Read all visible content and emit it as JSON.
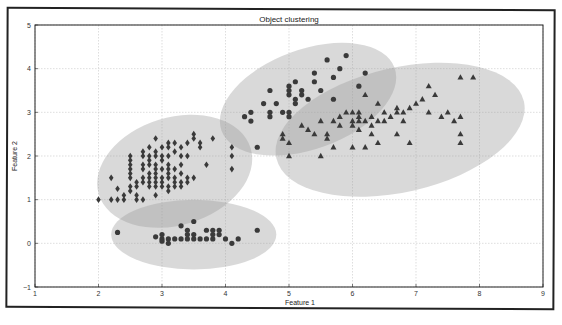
{
  "chart_data": {
    "type": "scatter",
    "title": "Object clustering",
    "xlabel": "Feature 1",
    "ylabel": "Feature 2",
    "xlim": [
      1,
      9
    ],
    "ylim": [
      -1,
      5
    ],
    "xticks": [
      "1",
      "2",
      "3",
      "4",
      "5",
      "6",
      "7",
      "8",
      "9"
    ],
    "yticks": [
      "-1",
      "0",
      "1",
      "2",
      "3",
      "4",
      "5"
    ],
    "grid": true,
    "legend": null,
    "ellipses": [
      {
        "name": "cluster-diamonds",
        "cx": 3.2,
        "cy": 1.65,
        "rx": 1.25,
        "ry": 0.65,
        "angle": -17
      },
      {
        "name": "cluster-bottom-circles",
        "cx": 3.5,
        "cy": 0.2,
        "rx": 1.3,
        "ry": 0.42,
        "angle": 0
      },
      {
        "name": "cluster-upper-circles",
        "cx": 5.3,
        "cy": 3.3,
        "rx": 1.45,
        "ry": 0.6,
        "angle": -20
      },
      {
        "name": "cluster-triangles",
        "cx": 6.75,
        "cy": 2.6,
        "rx": 2.0,
        "ry": 0.75,
        "angle": -13
      }
    ],
    "series": [
      {
        "name": "Cluster 1 (diamonds)",
        "marker": "diamond",
        "points": [
          [
            2.0,
            1.0
          ],
          [
            2.2,
            1.0
          ],
          [
            2.3,
            1.0
          ],
          [
            2.4,
            1.0
          ],
          [
            2.4,
            1.1
          ],
          [
            2.6,
            1.0
          ],
          [
            2.6,
            1.1
          ],
          [
            2.7,
            1.0
          ],
          [
            2.2,
            1.5
          ],
          [
            2.3,
            1.25
          ],
          [
            2.5,
            1.2
          ],
          [
            2.5,
            1.3
          ],
          [
            2.5,
            1.5
          ],
          [
            2.5,
            1.6
          ],
          [
            2.5,
            1.7
          ],
          [
            2.5,
            1.8
          ],
          [
            2.5,
            1.9
          ],
          [
            2.5,
            2.0
          ],
          [
            2.6,
            1.3
          ],
          [
            2.6,
            1.4
          ],
          [
            2.7,
            1.4
          ],
          [
            2.7,
            1.5
          ],
          [
            2.7,
            1.7
          ],
          [
            2.7,
            1.8
          ],
          [
            2.7,
            2.0
          ],
          [
            2.7,
            2.1
          ],
          [
            2.8,
            1.3
          ],
          [
            2.8,
            1.4
          ],
          [
            2.8,
            1.5
          ],
          [
            2.8,
            1.6
          ],
          [
            2.8,
            1.8
          ],
          [
            2.8,
            1.9
          ],
          [
            2.8,
            2.0
          ],
          [
            2.8,
            2.2
          ],
          [
            2.9,
            1.1
          ],
          [
            2.9,
            1.3
          ],
          [
            2.9,
            1.4
          ],
          [
            2.9,
            1.5
          ],
          [
            2.9,
            1.6
          ],
          [
            2.9,
            1.7
          ],
          [
            2.9,
            1.8
          ],
          [
            2.9,
            2.0
          ],
          [
            2.9,
            2.1
          ],
          [
            2.9,
            2.4
          ],
          [
            3.0,
            1.3
          ],
          [
            3.0,
            1.4
          ],
          [
            3.0,
            1.5
          ],
          [
            3.0,
            1.7
          ],
          [
            3.0,
            1.9
          ],
          [
            3.0,
            2.0
          ],
          [
            3.0,
            2.2
          ],
          [
            3.1,
            1.2
          ],
          [
            3.1,
            1.3
          ],
          [
            3.1,
            1.5
          ],
          [
            3.1,
            1.6
          ],
          [
            3.1,
            1.7
          ],
          [
            3.1,
            1.8
          ],
          [
            3.1,
            2.0
          ],
          [
            3.1,
            2.2
          ],
          [
            3.1,
            2.3
          ],
          [
            3.2,
            1.3
          ],
          [
            3.2,
            1.4
          ],
          [
            3.2,
            1.5
          ],
          [
            3.2,
            1.7
          ],
          [
            3.2,
            2.1
          ],
          [
            3.2,
            2.3
          ],
          [
            3.3,
            1.3
          ],
          [
            3.3,
            1.4
          ],
          [
            3.3,
            1.6
          ],
          [
            3.3,
            1.8
          ],
          [
            3.3,
            2.0
          ],
          [
            3.3,
            2.2
          ],
          [
            3.4,
            1.4
          ],
          [
            3.4,
            1.5
          ],
          [
            3.4,
            2.0
          ],
          [
            3.4,
            2.3
          ],
          [
            3.5,
            1.5
          ],
          [
            3.5,
            2.4
          ],
          [
            3.5,
            2.5
          ],
          [
            3.6,
            2.3
          ],
          [
            3.6,
            2.2
          ],
          [
            3.7,
            1.8
          ],
          [
            3.8,
            2.4
          ],
          [
            4.1,
            2.0
          ],
          [
            4.1,
            2.2
          ],
          [
            4.1,
            1.7
          ]
        ]
      },
      {
        "name": "Cluster 2 (bottom circles)",
        "marker": "circle",
        "points": [
          [
            2.3,
            0.25
          ],
          [
            2.9,
            0.15
          ],
          [
            3.0,
            0.1
          ],
          [
            3.0,
            0.2
          ],
          [
            3.0,
            0.05
          ],
          [
            3.1,
            0.1
          ],
          [
            3.1,
            0.0
          ],
          [
            3.2,
            0.1
          ],
          [
            3.3,
            0.1
          ],
          [
            3.3,
            0.4
          ],
          [
            3.4,
            0.1
          ],
          [
            3.4,
            0.3
          ],
          [
            3.4,
            0.2
          ],
          [
            3.5,
            0.1
          ],
          [
            3.5,
            0.2
          ],
          [
            3.5,
            0.5
          ],
          [
            3.6,
            0.1
          ],
          [
            3.7,
            0.1
          ],
          [
            3.7,
            0.3
          ],
          [
            3.8,
            0.1
          ],
          [
            3.8,
            0.2
          ],
          [
            3.8,
            0.3
          ],
          [
            3.9,
            0.2
          ],
          [
            3.9,
            0.3
          ],
          [
            4.0,
            0.1
          ],
          [
            4.1,
            0.0
          ],
          [
            4.2,
            0.1
          ],
          [
            4.5,
            0.3
          ]
        ]
      },
      {
        "name": "Cluster 3 (upper circles)",
        "marker": "circle",
        "points": [
          [
            4.3,
            2.9
          ],
          [
            4.4,
            3.0
          ],
          [
            4.4,
            2.8
          ],
          [
            4.5,
            2.2
          ],
          [
            4.6,
            3.2
          ],
          [
            4.7,
            3.5
          ],
          [
            4.7,
            3.0
          ],
          [
            4.7,
            2.9
          ],
          [
            4.8,
            3.2
          ],
          [
            4.9,
            3.0
          ],
          [
            5.0,
            3.0
          ],
          [
            5.0,
            2.9
          ],
          [
            5.0,
            3.4
          ],
          [
            5.0,
            3.6
          ],
          [
            5.0,
            3.5
          ],
          [
            5.1,
            3.7
          ],
          [
            5.1,
            3.3
          ],
          [
            5.1,
            3.2
          ],
          [
            5.2,
            3.4
          ],
          [
            5.2,
            3.5
          ],
          [
            5.3,
            3.3
          ],
          [
            5.4,
            3.7
          ],
          [
            5.4,
            3.9
          ],
          [
            5.5,
            3.5
          ],
          [
            5.6,
            4.2
          ],
          [
            5.7,
            3.8
          ],
          [
            5.7,
            3.3
          ],
          [
            5.9,
            4.3
          ],
          [
            5.8,
            4.0
          ],
          [
            6.1,
            3.6
          ],
          [
            6.2,
            3.9
          ]
        ]
      },
      {
        "name": "Cluster 4 (triangles)",
        "marker": "triangle",
        "points": [
          [
            4.9,
            2.4
          ],
          [
            4.9,
            2.5
          ],
          [
            5.0,
            2.3
          ],
          [
            5.0,
            2.0
          ],
          [
            5.2,
            2.7
          ],
          [
            5.3,
            2.6
          ],
          [
            5.4,
            2.5
          ],
          [
            5.5,
            2.8
          ],
          [
            5.5,
            2.0
          ],
          [
            5.6,
            2.4
          ],
          [
            5.6,
            2.5
          ],
          [
            5.7,
            2.2
          ],
          [
            5.7,
            2.8
          ],
          [
            5.8,
            2.7
          ],
          [
            5.8,
            2.9
          ],
          [
            5.9,
            3.0
          ],
          [
            6.0,
            2.2
          ],
          [
            6.0,
            2.7
          ],
          [
            6.0,
            2.8
          ],
          [
            6.0,
            3.0
          ],
          [
            6.1,
            2.6
          ],
          [
            6.1,
            2.8
          ],
          [
            6.1,
            2.9
          ],
          [
            6.1,
            3.0
          ],
          [
            6.2,
            2.2
          ],
          [
            6.2,
            2.8
          ],
          [
            6.2,
            3.4
          ],
          [
            6.3,
            2.5
          ],
          [
            6.3,
            2.7
          ],
          [
            6.3,
            2.9
          ],
          [
            6.4,
            2.8
          ],
          [
            6.4,
            2.3
          ],
          [
            6.4,
            3.2
          ],
          [
            6.5,
            2.8
          ],
          [
            6.5,
            3.0
          ],
          [
            6.6,
            2.9
          ],
          [
            6.7,
            3.0
          ],
          [
            6.7,
            2.5
          ],
          [
            6.7,
            3.1
          ],
          [
            6.8,
            2.8
          ],
          [
            6.8,
            3.0
          ],
          [
            6.9,
            3.1
          ],
          [
            6.9,
            2.3
          ],
          [
            7.0,
            3.2
          ],
          [
            7.1,
            3.3
          ],
          [
            7.2,
            3.0
          ],
          [
            7.2,
            3.6
          ],
          [
            7.4,
            2.9
          ],
          [
            7.6,
            2.8
          ],
          [
            7.7,
            2.9
          ],
          [
            7.7,
            2.5
          ],
          [
            7.7,
            2.3
          ],
          [
            7.7,
            3.8
          ],
          [
            7.9,
            3.8
          ],
          [
            7.3,
            3.4
          ],
          [
            7.5,
            3.0
          ]
        ]
      }
    ]
  }
}
